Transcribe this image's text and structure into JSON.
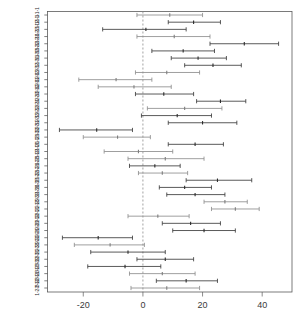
{
  "chart_data": {
    "type": "line",
    "title": "",
    "subtitle": "",
    "xlabel": "",
    "ylabel": "",
    "orientation": "horizontal",
    "plot_style": "forest-plot",
    "grid": false,
    "legend": "none",
    "xlim": [
      -32,
      50
    ],
    "x_ticks": [
      -20,
      0,
      20,
      40
    ],
    "x_tick_labels": [
      "-20",
      "0",
      "20",
      "40"
    ],
    "reference_line": {
      "value": 0,
      "style": "dashed",
      "color": "#8a8a8a"
    },
    "value_description": "Point estimate with confidence interval per group",
    "categories": [
      "2-1-1-1",
      "3-1-1-1",
      "1-2-1-1",
      "2-2-1-1",
      "3-2-1-1",
      "1-3-1-1",
      "2-3-1-1",
      "3-3-1-1",
      "1-1-2-1",
      "2-1-2-1",
      "3-1-2-1",
      "1-2-2-1",
      "2-2-2-1",
      "3-2-2-1",
      "1-3-2-1",
      "2-3-2-1",
      "3-3-2-1",
      "1-1-1-2",
      "2-1-1-2",
      "3-1-1-2",
      "1-2-1-2",
      "2-2-1-2",
      "3-2-1-2",
      "1-3-1-2",
      "2-3-1-2",
      "3-3-1-2",
      "1-1-2-2",
      "2-1-2-2",
      "3-1-2-2",
      "1-2-2-2",
      "2-2-2-2",
      "3-2-2-2",
      "1-3-2-2",
      "2-3-2-2",
      "3-3-2-2",
      "1-1-3-2",
      "2-1-3-2",
      "3-1-3-2",
      "1-2-3-2"
    ],
    "series": [
      {
        "name": "estimate",
        "values": [
          9.0,
          17.0,
          1.0,
          10.5,
          34.0,
          13.5,
          18.5,
          23.5,
          8.0,
          -9.0,
          -3.0,
          7.0,
          26.0,
          14.0,
          11.5,
          20.0,
          -15.5,
          -8.5,
          17.5,
          -1.5,
          7.5,
          4.0,
          6.5,
          25.0,
          14.0,
          17.5,
          27.5,
          31.0,
          5.0,
          16.0,
          20.5,
          -15.0,
          -11.0,
          -5.0,
          7.5,
          -6.0,
          6.5,
          14.5,
          8.0
        ]
      },
      {
        "name": "ci_low",
        "values": [
          -2.0,
          8.5,
          -13.5,
          -2.0,
          22.5,
          3.0,
          9.5,
          14.0,
          -2.5,
          -21.5,
          -15.0,
          -2.5,
          18.0,
          1.5,
          -0.5,
          8.5,
          -28.0,
          -20.0,
          8.5,
          -13.0,
          -5.0,
          -4.5,
          -1.5,
          14.5,
          5.5,
          8.0,
          20.5,
          23.0,
          -5.0,
          6.5,
          10.0,
          -27.0,
          -23.0,
          -17.5,
          -2.0,
          -18.5,
          -4.5,
          4.5,
          -4.0
        ]
      },
      {
        "name": "ci_high",
        "values": [
          20.0,
          26.0,
          14.5,
          22.5,
          45.5,
          24.0,
          28.0,
          33.0,
          19.0,
          3.0,
          9.5,
          17.0,
          34.5,
          26.5,
          23.0,
          31.5,
          -3.5,
          2.5,
          27.0,
          10.0,
          20.5,
          12.5,
          15.0,
          36.5,
          23.0,
          27.5,
          35.0,
          39.0,
          15.5,
          26.0,
          31.0,
          -3.5,
          0.5,
          7.5,
          17.0,
          6.0,
          17.5,
          25.0,
          19.0
        ]
      }
    ],
    "tone": [
      "light",
      "dark",
      "dark",
      "light",
      "dark",
      "dark",
      "dark",
      "dark",
      "light",
      "light",
      "light",
      "dark",
      "dark",
      "light",
      "dark",
      "dark",
      "dark",
      "light",
      "dark",
      "light",
      "light",
      "dark",
      "light",
      "dark",
      "dark",
      "dark",
      "light",
      "light",
      "light",
      "dark",
      "dark",
      "dark",
      "light",
      "dark",
      "dark",
      "dark",
      "light",
      "dark",
      "light"
    ]
  },
  "axes": {
    "x_axis_name": "effect-size-axis",
    "y_axis_name": "group-label-axis"
  }
}
